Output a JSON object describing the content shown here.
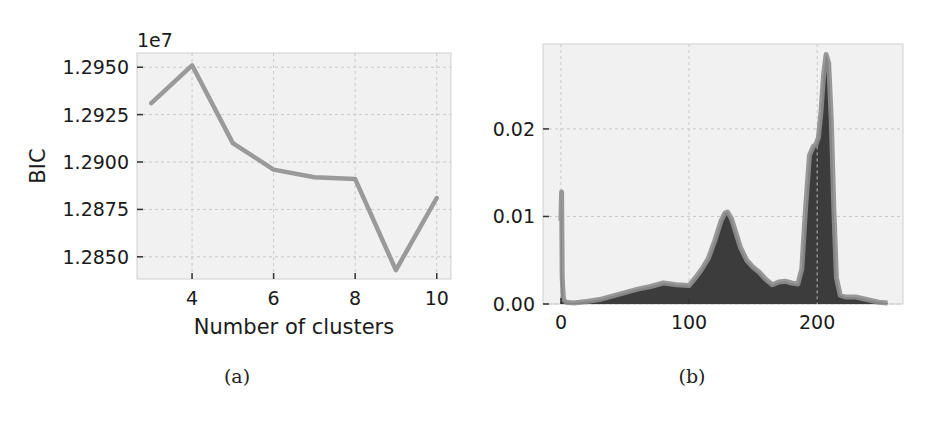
{
  "figure": {
    "captions": [
      "(a)",
      "(b)"
    ]
  },
  "chart_data": [
    {
      "type": "line",
      "panel": "(a)",
      "title": "",
      "xlabel": "Number of clusters",
      "ylabel": "BIC",
      "offset_label": "1e7",
      "x": [
        3,
        4,
        5,
        6,
        7,
        8,
        9,
        10
      ],
      "values": [
        1.2931,
        1.2951,
        1.291,
        1.2896,
        1.2892,
        1.2891,
        1.2843,
        1.2881
      ],
      "xticks": [
        4,
        6,
        8,
        10
      ],
      "yticks": [
        "1.2850",
        "1.2875",
        "1.2900",
        "1.2925",
        "1.2950"
      ],
      "xlim": [
        2.65,
        10.35
      ],
      "ylim": [
        1.28383,
        1.29575
      ],
      "grid": true,
      "line_color": "#9a9a9a"
    },
    {
      "type": "area",
      "panel": "(b)",
      "title": "",
      "xlabel": "",
      "ylabel": "",
      "x": [
        0,
        0.5,
        1,
        2,
        4,
        10,
        20,
        30,
        40,
        50,
        60,
        70,
        80,
        90,
        100,
        105,
        110,
        115,
        120,
        125,
        128,
        130,
        133,
        136,
        140,
        145,
        150,
        155,
        160,
        165,
        170,
        175,
        180,
        185,
        188,
        191,
        194,
        197,
        199,
        201,
        203,
        205,
        207,
        209,
        211,
        213,
        215,
        218,
        222,
        230,
        236,
        242,
        248,
        255
      ],
      "values": [
        0.0095,
        0.0128,
        0.003,
        0.0005,
        0.0002,
        0.0001,
        0.0003,
        0.0005,
        0.0009,
        0.0013,
        0.0017,
        0.002,
        0.0024,
        0.0022,
        0.0021,
        0.003,
        0.004,
        0.0052,
        0.0072,
        0.0095,
        0.0104,
        0.0105,
        0.0098,
        0.0084,
        0.0065,
        0.005,
        0.0042,
        0.0036,
        0.0028,
        0.0022,
        0.0025,
        0.0026,
        0.0024,
        0.0023,
        0.004,
        0.011,
        0.017,
        0.018,
        0.0182,
        0.019,
        0.022,
        0.0262,
        0.0285,
        0.0275,
        0.021,
        0.011,
        0.003,
        0.001,
        0.0008,
        0.0008,
        0.0006,
        0.0004,
        0.0002,
        0.0001
      ],
      "xticks": [
        0,
        100,
        200
      ],
      "yticks": [
        "0.00",
        "0.01",
        "0.02"
      ],
      "xlim": [
        -14,
        267
      ],
      "ylim": [
        0.0,
        0.0297
      ],
      "grid": true,
      "fill_color": "#3c3c3c",
      "line_color": "#8e8e8e"
    }
  ]
}
